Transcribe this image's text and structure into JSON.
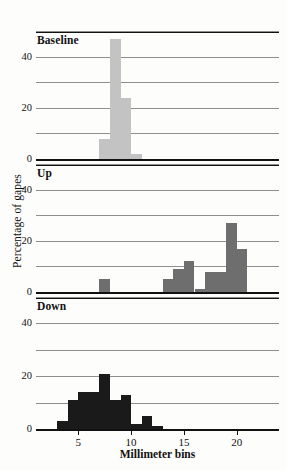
{
  "figure": {
    "xlabel": "Millimeter bins",
    "ylabel": "Percentage of gapes"
  },
  "axis": {
    "yticks": [
      "0",
      "20",
      "40"
    ],
    "xticks": [
      "5",
      "10",
      "15",
      "20"
    ]
  },
  "panels": [
    {
      "title": "Baseline"
    },
    {
      "title": "Up"
    },
    {
      "title": "Down"
    }
  ],
  "chart_data": {
    "type": "bar",
    "title": "",
    "xlabel": "Millimeter bins",
    "ylabel": "Percentage of gapes",
    "xlim": [
      1,
      24
    ],
    "ylim": [
      0,
      50
    ],
    "yticks": [
      0,
      20,
      40
    ],
    "ygrid_step": 10,
    "xticks": [
      5,
      10,
      15,
      20
    ],
    "grid": true,
    "legend": "none",
    "bin_width_mm": 1,
    "panels": [
      {
        "name": "Baseline",
        "color": "#c3c3c3",
        "x": [
          7,
          8,
          9,
          10
        ],
        "values": [
          8,
          47,
          24,
          2
        ]
      },
      {
        "name": "Up",
        "color": "#6e6e6e",
        "x": [
          7,
          13,
          14,
          15,
          16,
          17,
          18,
          19,
          20
        ],
        "values": [
          5,
          5,
          9,
          12,
          1,
          8,
          8,
          27,
          17
        ]
      },
      {
        "name": "Down",
        "color": "#1a1a1a",
        "x": [
          3,
          4,
          5,
          6,
          7,
          8,
          9,
          10,
          11,
          12
        ],
        "values": [
          3,
          11,
          14,
          14,
          21,
          11,
          13,
          2,
          5,
          1
        ]
      }
    ]
  }
}
